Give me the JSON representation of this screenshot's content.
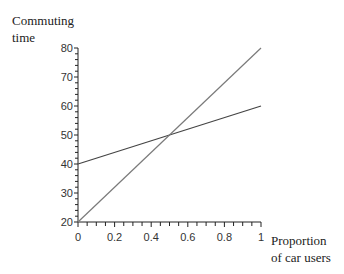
{
  "chart_data": {
    "type": "line",
    "title": "",
    "ylabel_lines": [
      "Commuting",
      "time"
    ],
    "xlabel_lines": [
      "Proportion",
      "of car users"
    ],
    "xlim": [
      0,
      1
    ],
    "ylim": [
      20,
      80
    ],
    "x_ticks": [
      "0",
      "0.2",
      "0.4",
      "0.6",
      "0.8",
      "1"
    ],
    "y_ticks": [
      "20",
      "30",
      "40",
      "50",
      "60",
      "70",
      "80"
    ],
    "grid": false,
    "legend": null,
    "series": [
      {
        "name": "line-a",
        "x": [
          0,
          1
        ],
        "values": [
          40,
          60
        ],
        "color": "#444444"
      },
      {
        "name": "line-b",
        "x": [
          0,
          1
        ],
        "values": [
          20,
          80
        ],
        "color": "#7a7a7a"
      }
    ],
    "annotations": []
  }
}
